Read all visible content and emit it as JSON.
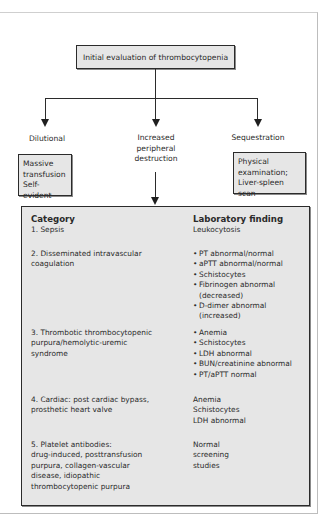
{
  "title": "Initial evaluation of thrombocytopenia",
  "branches": [
    {
      "label": "Dilutional",
      "box_lines": [
        "Massive",
        "transfusion",
        "Self-evident"
      ]
    },
    {
      "label_lines": [
        "Increased",
        "peripheral",
        "destruction"
      ]
    },
    {
      "label": "Sequestration",
      "box_lines": [
        "Physical",
        "examination;",
        "Liver-spleen scan"
      ]
    }
  ],
  "table": {
    "headers": {
      "category": "Category",
      "finding": "Laboratory finding"
    },
    "rows": [
      {
        "category_lines": [
          "1. Sepsis"
        ],
        "findings": [
          "Leukocytosis"
        ],
        "bulleted": false
      },
      {
        "category_lines": [
          "2. Disseminated intravascular",
          "coagulation"
        ],
        "findings": [
          "PT abnormal/normal",
          "aPTT abnormal/normal",
          "Schistocytes",
          "Fibrinogen abnormal (decreased)",
          "D-dimer abnormal (increased)"
        ],
        "bulleted": true
      },
      {
        "category_lines": [
          "3. Thrombotic thrombocytopenic",
          "purpura/hemolytic-uremic",
          "syndrome"
        ],
        "findings": [
          "Anemia",
          "Schistocytes",
          "LDH abnormal",
          "BUN/creatinine abnormal",
          "PT/aPTT normal"
        ],
        "bulleted": true
      },
      {
        "category_lines": [
          "4. Cardiac: post cardiac bypass,",
          "prosthetic heart valve"
        ],
        "findings": [
          "Anemia",
          "Schistocytes",
          "LDH abnormal"
        ],
        "bulleted": false
      },
      {
        "category_lines": [
          "5. Platelet antibodies:",
          "drug-induced, posttransfusion",
          "purpura, collagen-vascular",
          "disease, idiopathic",
          "thrombocytopenic purpura"
        ],
        "findings": [
          "Normal",
          "screening",
          "studies"
        ],
        "bulleted": false
      }
    ]
  },
  "colors": {
    "box_fill": "#e6e6e6",
    "line": "#2b2b2b",
    "text": "#2a2a2a"
  }
}
